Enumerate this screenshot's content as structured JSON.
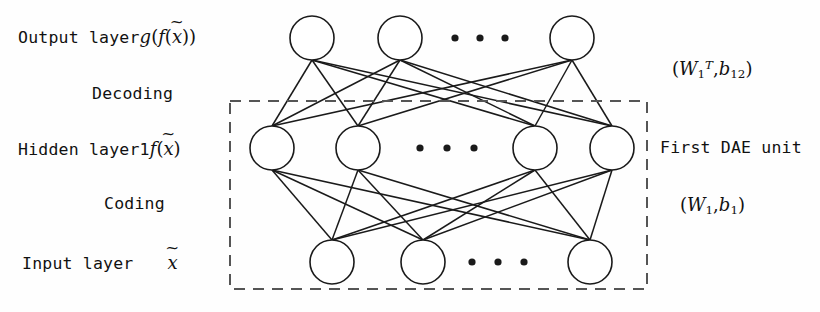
{
  "figure": {
    "type": "neural-network-diagram",
    "stroke_color": "#1a1a1a",
    "node_fill": "#ffffff",
    "dashed_box_color": "#555555"
  },
  "left_labels": {
    "output_layer": {
      "text": "Output layer",
      "math_g": "g",
      "math_open1": "(",
      "math_f": "f",
      "math_open2": "(",
      "math_x": "x",
      "tilde": "~",
      "math_close2": ")",
      "math_close1": ")"
    },
    "decoding": {
      "text": "Decoding"
    },
    "hidden_layer": {
      "text": "Hidden layer",
      "index": "1",
      "math_f": "f",
      "math_open": "(",
      "math_x": "x",
      "tilde": "~",
      "math_close": ")"
    },
    "coding": {
      "text": "Coding"
    },
    "input_layer": {
      "text": "Input layer",
      "math_x": "x",
      "tilde": "~"
    }
  },
  "right_labels": {
    "decoder_params": {
      "open": "(",
      "w": "W",
      "w_sub": "1",
      "w_sup": "T",
      "comma": ",",
      "b": "b",
      "b_sub": "12",
      "close": ")"
    },
    "unit_name": {
      "text": "First DAE unit"
    },
    "encoder_params": {
      "open": "(",
      "w": "W",
      "w_sub": "1",
      "comma": ",",
      "b": "b",
      "b_sub": "1",
      "close": ")"
    }
  },
  "network": {
    "node_radius": 22,
    "dot_radius": 3.6,
    "layers": [
      {
        "name": "output-layer",
        "y": 38,
        "nodes_x": [
          312,
          400,
          572
        ],
        "ellipsis_x": [
          455,
          480,
          505
        ],
        "ellipsis_y": 38
      },
      {
        "name": "hidden-layer-1",
        "y": 148,
        "nodes_x": [
          272,
          358,
          535,
          612
        ],
        "ellipsis_x": [
          420,
          447,
          474
        ],
        "ellipsis_y": 148
      },
      {
        "name": "input-layer",
        "y": 262,
        "nodes_x": [
          332,
          423,
          590
        ],
        "ellipsis_x": [
          472,
          498,
          524
        ],
        "ellipsis_y": 262
      }
    ],
    "dashed_box": {
      "x": 230,
      "y": 101,
      "width": 417,
      "height": 188
    }
  }
}
